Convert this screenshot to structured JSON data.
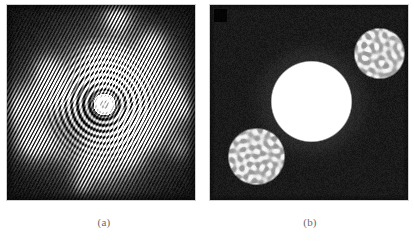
{
  "figure": {
    "background_color": "#ffffff",
    "panel_count": 2
  },
  "captions": {
    "a": "(a)",
    "b": "(b)"
  },
  "panel_a": {
    "label": "(a)",
    "description": "grayscale interferogram with concentric fringe rings and speckle",
    "frame": {
      "x": 6,
      "y": 4,
      "width": 190,
      "height": 197
    },
    "background_color": "#101010",
    "center": {
      "x": 97,
      "y": 99
    },
    "ring_count": 9,
    "ring_spacing_px": 6,
    "inner_disk_radius_px": 11,
    "speckle_blob_count": 46,
    "striation_angle_deg": 28,
    "striation_period_px": 3.1,
    "envelope_radius_px": 80,
    "min_gray": "#080808",
    "max_gray": "#f2f2f2"
  },
  "panel_b": {
    "label": "(b)",
    "description": "dark field with one large saturated white disk and two labyrinthine pattern disks",
    "frame": {
      "x": 209,
      "y": 4,
      "width": 200,
      "height": 197
    },
    "background_color": "#1a1a1a",
    "corner_marker": {
      "x": 4,
      "y": 4,
      "width": 13,
      "height": 13,
      "color": "#000000"
    },
    "main_disk": {
      "cx": 101,
      "cy": 96,
      "r": 41,
      "color": "#ffffff",
      "label": "uniform-state-disk"
    },
    "pattern_disks": [
      {
        "cx": 169,
        "cy": 48,
        "r": 26,
        "label": "labyrinth-disk-top-right",
        "base_color": "#b9b9b9",
        "stripe_color": "#f0f0f0"
      },
      {
        "cx": 46,
        "cy": 151,
        "r": 29,
        "label": "labyrinth-disk-bottom-left",
        "base_color": "#b9b9b9",
        "stripe_color": "#f0f0f0"
      }
    ]
  },
  "chart_data": {
    "type": "heatmap",
    "title": "",
    "panels": [
      {
        "id": "a",
        "caption": "(a)",
        "type": "heatmap",
        "colormap": "gray",
        "value_range": [
          0,
          255
        ],
        "features": [
          "concentric rings",
          "radial speckle",
          "diagonal striations"
        ]
      },
      {
        "id": "b",
        "caption": "(b)",
        "type": "heatmap",
        "colormap": "gray",
        "value_range": [
          0,
          255
        ],
        "features": [
          "saturated white disk",
          "two labyrinthine domains",
          "dark background"
        ]
      }
    ]
  }
}
